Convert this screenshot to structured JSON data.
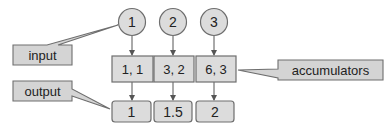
{
  "diagram": {
    "inputs": [
      "1",
      "2",
      "3"
    ],
    "accumulators": [
      "1, 1",
      "3, 2",
      "6, 3"
    ],
    "outputs": [
      "1",
      "1.5",
      "2"
    ],
    "callouts": {
      "input": "input",
      "output": "output",
      "accumulators": "accumulators"
    },
    "colors": {
      "fill": "#dcdcdc",
      "callout_fill": "#d4d4d4",
      "stroke": "#6e6e6e",
      "text": "#222222"
    }
  }
}
